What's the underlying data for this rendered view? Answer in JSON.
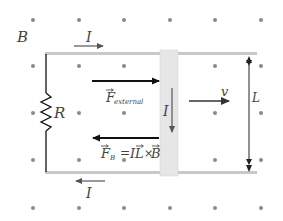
{
  "diagram": {
    "field_label": "B",
    "field_direction": "out-of-page (dots)",
    "dot_grid": {
      "columns_x": [
        33,
        79,
        124,
        170,
        215,
        261
      ],
      "rows_y": [
        20,
        66,
        113,
        160,
        208
      ]
    },
    "current_top_label": "I",
    "current_bottom_label": "I",
    "current_rod_label": "I",
    "resistor_label": "R",
    "force_external": {
      "symbol": "F",
      "subscript": "external"
    },
    "force_magnetic": {
      "symbol": "F",
      "subscript": "B",
      "equation_rhs": "= IL × B",
      "eq_I": "I",
      "eq_L": "L",
      "eq_times": "×",
      "eq_B": "B",
      "eq_equals": "="
    },
    "velocity_label": "v",
    "length_label": "L",
    "colors": {
      "rail": "#c8c8c8",
      "rod": "#e4e4e4",
      "dot": "#8a8a8a",
      "arrow": "#111111",
      "current_arrow": "#555555"
    }
  }
}
